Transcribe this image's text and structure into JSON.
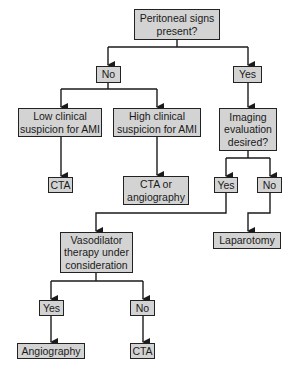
{
  "diagram": {
    "type": "flowchart",
    "nodes": {
      "peritoneal": "Peritoneal signs\npresent?",
      "no1": "No",
      "yes1": "Yes",
      "low": "Low clinical\nsuspicion for AMI",
      "high": "High clinical\nsuspicion for AMI",
      "imaging": "Imaging\nevaluation\ndesired?",
      "cta1": "CTA",
      "cta_or_angio": "CTA or\nangiography",
      "yes2": "Yes",
      "no2": "No",
      "vasodilator": "Vasodilator\ntherapy under\nconsideration",
      "laparotomy": "Laparotomy",
      "yes3": "Yes",
      "no3": "No",
      "angiography": "Angiography",
      "cta2": "CTA"
    },
    "edges": [
      [
        "peritoneal",
        "no1"
      ],
      [
        "peritoneal",
        "yes1"
      ],
      [
        "no1",
        "low"
      ],
      [
        "no1",
        "high"
      ],
      [
        "yes1",
        "imaging"
      ],
      [
        "low",
        "cta1"
      ],
      [
        "high",
        "cta_or_angio"
      ],
      [
        "imaging",
        "yes2"
      ],
      [
        "imaging",
        "no2"
      ],
      [
        "yes2",
        "vasodilator"
      ],
      [
        "no2",
        "laparotomy"
      ],
      [
        "vasodilator",
        "yes3"
      ],
      [
        "vasodilator",
        "no3"
      ],
      [
        "yes3",
        "angiography"
      ],
      [
        "no3",
        "cta2"
      ]
    ],
    "colors": {
      "box_fill": "#d3d3d3",
      "border": "#222222",
      "line": "#1a1a1a"
    }
  }
}
